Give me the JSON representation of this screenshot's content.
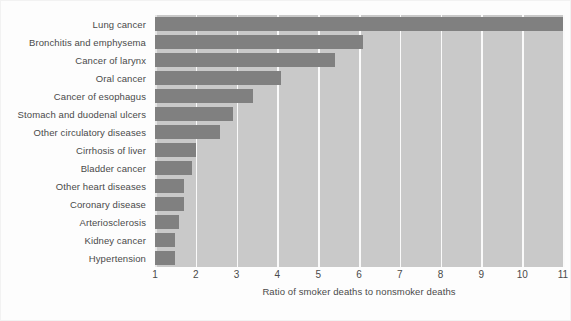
{
  "chart_data": {
    "type": "bar",
    "orientation": "horizontal",
    "title": "",
    "xlabel": "Ratio of smoker deaths to nonsmoker deaths",
    "ylabel": "",
    "xlim": [
      1,
      11
    ],
    "xticks": [
      1,
      2,
      3,
      4,
      5,
      6,
      7,
      8,
      9,
      10,
      11
    ],
    "xtick_labels": [
      "1",
      "2",
      "3",
      "4",
      "5",
      "6",
      "7",
      "8",
      "9",
      "10",
      "11"
    ],
    "grid": "vertical-white",
    "legend": "none",
    "categories": [
      "Lung cancer",
      "Bronchitis and emphysema",
      "Cancer of larynx",
      "Oral cancer",
      "Cancer of esophagus",
      "Stomach and duodenal ulcers",
      "Other circulatory diseases",
      "Cirrhosis of liver",
      "Bladder cancer",
      "Other heart diseases",
      "Coronary disease",
      "Arteriosclerosis",
      "Kidney cancer",
      "Hypertension"
    ],
    "values": [
      11.0,
      6.1,
      5.4,
      4.1,
      3.4,
      2.9,
      2.6,
      2.0,
      1.9,
      1.7,
      1.7,
      1.6,
      1.5,
      1.5
    ],
    "colors": {
      "bar": "#808080",
      "plot_background": "#c9c9c9",
      "gridline": "#fafafa",
      "figure_background": "#fdfdfd",
      "text": "#4a4a4a"
    }
  }
}
